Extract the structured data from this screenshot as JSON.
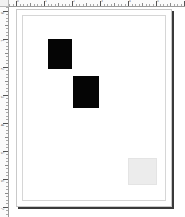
{
  "app": {
    "window_title": "Page Layout",
    "view_mode": "Page view"
  },
  "rulers": {
    "corner_label": "",
    "unit": "cm",
    "horizontal": {
      "name": "horizontal-ruler",
      "origin_px": 16,
      "major_every_px": 28,
      "minor_every_px": 3.5,
      "labels": [
        "0",
        "1",
        "2",
        "3",
        "4",
        "5"
      ]
    },
    "vertical": {
      "name": "vertical-ruler",
      "origin_px": 9,
      "major_every_px": 28,
      "minor_every_px": 3.5,
      "labels": [
        "0",
        "1",
        "2",
        "3",
        "4",
        "5",
        "6",
        "7"
      ]
    }
  },
  "page": {
    "name": "document-page",
    "background": "#ffffff",
    "border_color": "#c9c9c9",
    "shadow_color": "#3a3a3a",
    "margin_guide_color": "#d6d6d6",
    "left": 7,
    "top": 2,
    "width": 156,
    "height": 198
  },
  "objects": [
    {
      "name": "image-frame-1",
      "type": "image-frame",
      "label": "",
      "fill": "#050505",
      "left": 31,
      "top": 29,
      "width": 24,
      "height": 30,
      "selected": false
    },
    {
      "name": "image-frame-2",
      "type": "image-frame",
      "label": "",
      "fill": "#050505",
      "left": 56,
      "top": 66,
      "width": 26,
      "height": 32,
      "selected": false
    },
    {
      "name": "empty-frame-1",
      "type": "empty-frame",
      "label": "",
      "fill": "#ececec",
      "left": 111,
      "top": 148,
      "width": 29,
      "height": 27,
      "selected": false
    }
  ]
}
